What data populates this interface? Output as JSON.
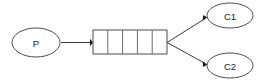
{
  "diagram": {
    "background_color": "#ffffff",
    "stroke_color": "#4d4d4d",
    "edge_color": "#3a3a3a",
    "text_color": "#1a1a1a",
    "nodes": {
      "producer": {
        "label": "P",
        "shape": "ellipse",
        "cx": 36,
        "cy": 42.5,
        "rx": 24,
        "ry": 14.5
      },
      "consumer1": {
        "label": "C1",
        "shape": "ellipse",
        "cx": 230,
        "cy": 15.5,
        "rx": 23,
        "ry": 12.5
      },
      "consumer2": {
        "label": "C2",
        "shape": "ellipse",
        "cx": 230,
        "cy": 65.5,
        "rx": 23,
        "ry": 12.5
      }
    },
    "buffer": {
      "label": "",
      "shape": "rectangle",
      "x": 93,
      "y": 30,
      "width": 74,
      "height": 24,
      "cell_count": 5,
      "divider_count": 4
    },
    "edges": [
      {
        "name": "producer-to-buffer",
        "from": "producer",
        "to": "buffer",
        "x1": 61,
        "y1": 42.5,
        "x2": 92,
        "y2": 42.5,
        "arrowhead": "filled"
      },
      {
        "name": "buffer-to-consumer1",
        "from": "buffer",
        "to": "consumer1",
        "x1": 168,
        "y1": 42.5,
        "x2": 207,
        "y2": 18,
        "arrowhead": "filled"
      },
      {
        "name": "buffer-to-consumer2",
        "from": "buffer",
        "to": "consumer2",
        "x1": 168,
        "y1": 42.5,
        "x2": 207,
        "y2": 63,
        "arrowhead": "filled"
      }
    ]
  }
}
